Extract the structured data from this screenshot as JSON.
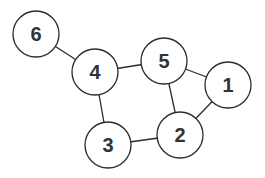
{
  "graph": {
    "colors": {
      "stroke": "#2b2b2b",
      "fill": "#ffffff",
      "label": "#333333"
    },
    "radius": 23,
    "nodes": [
      {
        "id": "1",
        "label": "1",
        "x": 228,
        "y": 85
      },
      {
        "id": "2",
        "label": "2",
        "x": 180,
        "y": 135
      },
      {
        "id": "3",
        "label": "3",
        "x": 108,
        "y": 145
      },
      {
        "id": "4",
        "label": "4",
        "x": 95,
        "y": 72
      },
      {
        "id": "5",
        "label": "5",
        "x": 164,
        "y": 61
      },
      {
        "id": "6",
        "label": "6",
        "x": 36,
        "y": 34
      }
    ],
    "edges": [
      {
        "from": "6",
        "to": "4"
      },
      {
        "from": "4",
        "to": "5"
      },
      {
        "from": "4",
        "to": "3"
      },
      {
        "from": "3",
        "to": "2"
      },
      {
        "from": "5",
        "to": "2"
      },
      {
        "from": "5",
        "to": "1"
      },
      {
        "from": "1",
        "to": "2"
      }
    ]
  }
}
